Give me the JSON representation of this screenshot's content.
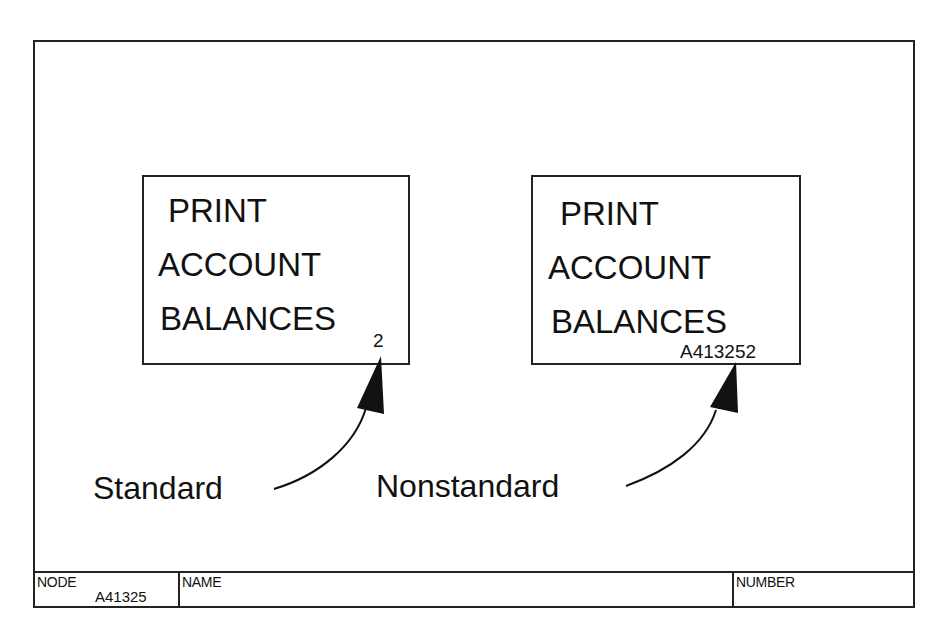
{
  "diagram": {
    "type": "IDEF0 box numbering convention",
    "boxes": [
      {
        "id": "standard-box",
        "lines": [
          "PRINT",
          "ACCOUNT",
          "BALANCES"
        ],
        "ref": "2",
        "caption": "Standard"
      },
      {
        "id": "nonstandard-box",
        "lines": [
          "PRINT",
          "ACCOUNT",
          "BALANCES"
        ],
        "ref": "A413252",
        "caption": "Nonstandard"
      }
    ],
    "edges": [
      {
        "from": "Standard caption",
        "to": "box number 2",
        "style": "curved arrow, solid filled head"
      },
      {
        "from": "Nonstandard caption",
        "to": "box number A413252",
        "style": "curved arrow, solid filled head"
      }
    ]
  },
  "titlebar": {
    "node_label": "NODE",
    "node_value": "A41325",
    "name_label": "NAME",
    "name_value": "",
    "number_label": "NUMBER",
    "number_value": ""
  },
  "colors": {
    "ink": "#111111",
    "background": "#ffffff"
  }
}
